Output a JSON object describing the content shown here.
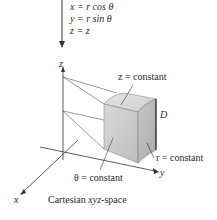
{
  "equations": [
    {
      "lhs": "x",
      "rhs_var": "r",
      "rhs_fn": "cos",
      "rhs_arg": "θ"
    },
    {
      "lhs": "y",
      "rhs_var": "r",
      "rhs_fn": "sin",
      "rhs_arg": "θ"
    },
    {
      "lhs": "z",
      "rhs_var": "z",
      "rhs_fn": "",
      "rhs_arg": ""
    }
  ],
  "equation_text": [
    "x = r cos θ",
    "y = r sin θ",
    "z = z"
  ],
  "axes": {
    "x": "x",
    "y": "y",
    "z": "z"
  },
  "labels": {
    "z_constant": "z = constant",
    "r_constant": "r = constant",
    "theta_constant": "θ = constant",
    "region": "D",
    "caption_prefix": "Cartesian ",
    "caption_italic": "xyz",
    "caption_suffix": "-space"
  },
  "colors": {
    "line": "#333333",
    "solid_top": "#d6d6d6",
    "solid_front": "#c4c4c4",
    "solid_side": "#b0b0b0"
  }
}
